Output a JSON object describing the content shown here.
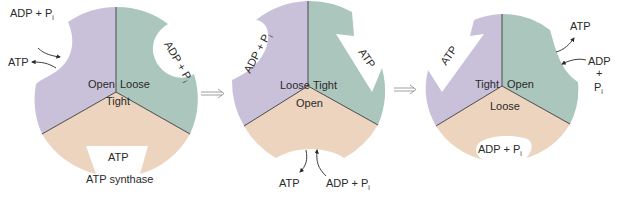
{
  "diagram": {
    "colors": {
      "purple": "#C9C1D9",
      "teal": "#AAC6BD",
      "peach": "#EDD4BF",
      "line": "#4a4a4a",
      "text": "#2a2a2a"
    },
    "stages": [
      {
        "segments": {
          "left": "Open",
          "right": "Loose",
          "bottom": "Tight"
        },
        "pocket_labels": {
          "right": "ADP + P",
          "right_sub": "i",
          "bottom": "ATP"
        },
        "external": {
          "in": "ADP + P",
          "in_sub": "i",
          "out": "ATP"
        },
        "caption": "ATP synthase"
      },
      {
        "segments": {
          "left": "Loose",
          "right": "Tight",
          "bottom": "Open"
        },
        "pocket_labels": {
          "left": "ADP + P",
          "left_sub": "i",
          "right": "ATP"
        },
        "external": {
          "out": "ATP",
          "in": "ADP + P",
          "in_sub": "i"
        }
      },
      {
        "segments": {
          "left": "Tight",
          "right": "Open",
          "bottom": "Loose"
        },
        "pocket_labels": {
          "left": "ATP",
          "bottom": "ADP + P",
          "bottom_sub": "i"
        },
        "external": {
          "out": "ATP",
          "in_line1": "ADP",
          "in_line2": "+",
          "in_line3": "P",
          "in_sub": "i"
        }
      }
    ],
    "transitions": [
      "⟹",
      "⟹"
    ]
  }
}
